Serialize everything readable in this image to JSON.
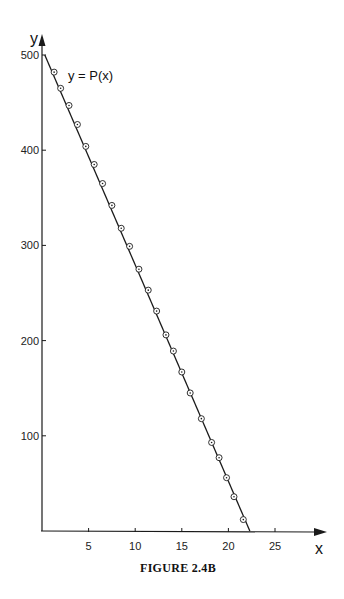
{
  "chart_data": {
    "type": "line",
    "title": "",
    "caption": "FIGURE 2.4B",
    "xlabel": "x",
    "ylabel": "y",
    "curve_label": "y = P(x)",
    "xlim": [
      0,
      30
    ],
    "ylim": [
      0,
      520
    ],
    "x_ticks": [
      5,
      10,
      15,
      20,
      25
    ],
    "y_ticks": [
      100,
      200,
      300,
      400,
      500
    ],
    "grid": false,
    "legend": "none",
    "series": [
      {
        "name": "y = P(x)",
        "style": "line with circle markers",
        "line": {
          "x": [
            0.3,
            22.3
          ],
          "y": [
            500,
            0
          ]
        },
        "points": {
          "x": [
            1.3,
            2.0,
            2.9,
            3.8,
            4.7,
            5.6,
            6.5,
            7.5,
            8.5,
            9.4,
            10.4,
            11.4,
            12.3,
            13.3,
            14.1,
            15.0,
            15.9,
            17.1,
            18.2,
            19.0,
            19.8,
            20.6,
            21.6
          ],
          "y": [
            482,
            465,
            447,
            427,
            404,
            385,
            365,
            342,
            318,
            299,
            275,
            253,
            231,
            206,
            189,
            167,
            145,
            118,
            93,
            77,
            56,
            36,
            12
          ]
        }
      }
    ]
  },
  "colors": {
    "ink": "#1a1a1a",
    "background": "#ffffff"
  }
}
